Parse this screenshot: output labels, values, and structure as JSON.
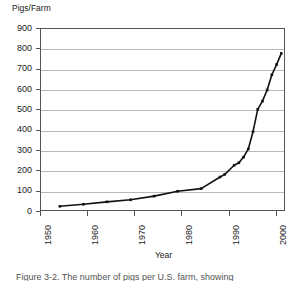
{
  "figure": {
    "ylabel": "Pigs/Farm",
    "xlabel": "Year",
    "caption": "Figure 3-2.  The number of pigs per U.S. farm, showing"
  },
  "axes": {
    "y_ticks": [
      "900",
      "800",
      "700",
      "600",
      "500",
      "400",
      "300",
      "200",
      "100",
      "0"
    ],
    "x_ticks": [
      "1950",
      "1960",
      "1970",
      "1980",
      "1990",
      "2000"
    ]
  },
  "chart_data": {
    "type": "line",
    "title": "",
    "xlabel": "Year",
    "ylabel": "Pigs/Farm",
    "xlim": [
      1950,
      2002
    ],
    "ylim": [
      0,
      900
    ],
    "ytick_step": 100,
    "grid": "horizontal",
    "legend": "none",
    "marker": "square",
    "x": [
      1954,
      1959,
      1964,
      1969,
      1974,
      1979,
      1984,
      1988,
      1989,
      1991,
      1992,
      1993,
      1994,
      1995,
      1996,
      1997,
      1998,
      1999,
      2000,
      2001
    ],
    "values": [
      28,
      38,
      50,
      60,
      78,
      102,
      115,
      172,
      185,
      230,
      242,
      270,
      310,
      395,
      505,
      545,
      600,
      675,
      725,
      780
    ],
    "series": [
      {
        "name": "Pigs per farm",
        "values": [
          28,
          38,
          50,
          60,
          78,
          102,
          115,
          172,
          185,
          230,
          242,
          270,
          310,
          395,
          505,
          545,
          600,
          675,
          725,
          780
        ]
      }
    ]
  },
  "colors": {
    "line": "#111111",
    "grid": "#b9b9b9",
    "frame": "#555555",
    "text": "#1c1c1c",
    "background": "#ffffff"
  }
}
